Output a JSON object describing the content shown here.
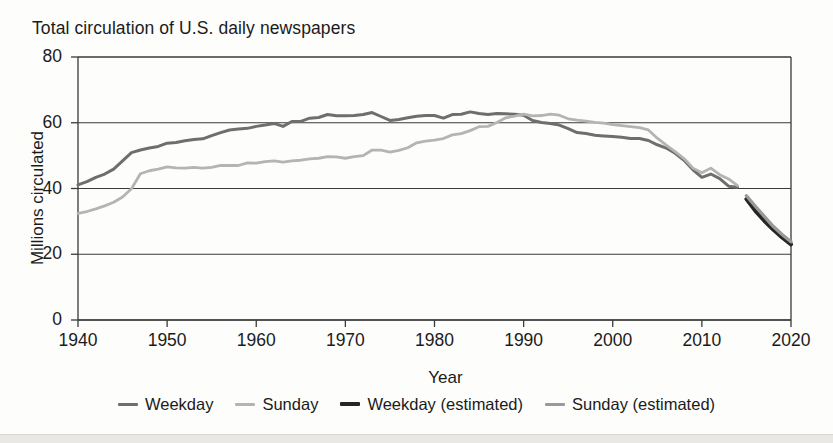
{
  "chart_data": {
    "type": "line",
    "title": "Total circulation of U.S. daily newspapers",
    "xlabel": "Year",
    "ylabel": "Millions circulated",
    "xlim": [
      1940,
      2020
    ],
    "ylim": [
      0,
      80
    ],
    "xticks": [
      1940,
      1950,
      1960,
      1970,
      1980,
      1990,
      2000,
      2010,
      2020
    ],
    "yticks": [
      0,
      20,
      40,
      60,
      80
    ],
    "grid": "horizontal",
    "legend_position": "bottom",
    "colors": {
      "weekday": "#6e6e6e",
      "sunday": "#b4b4b4",
      "weekday_estimated": "#262626",
      "sunday_estimated": "#9a9a9a"
    },
    "series": [
      {
        "name": "Weekday",
        "color": "#6e6e6e",
        "x": [
          1940,
          1941,
          1942,
          1943,
          1944,
          1945,
          1946,
          1947,
          1948,
          1949,
          1950,
          1951,
          1952,
          1953,
          1954,
          1955,
          1956,
          1957,
          1958,
          1959,
          1960,
          1961,
          1962,
          1963,
          1964,
          1965,
          1966,
          1967,
          1968,
          1969,
          1970,
          1971,
          1972,
          1973,
          1974,
          1975,
          1976,
          1977,
          1978,
          1979,
          1980,
          1981,
          1982,
          1983,
          1984,
          1985,
          1986,
          1987,
          1988,
          1989,
          1990,
          1991,
          1992,
          1993,
          1994,
          1995,
          1996,
          1997,
          1998,
          1999,
          2000,
          2001,
          2002,
          2003,
          2004,
          2005,
          2006,
          2007,
          2008,
          2009,
          2010,
          2011,
          2012,
          2013,
          2014
        ],
        "y": [
          41.1,
          42.1,
          43.4,
          44.4,
          45.9,
          48.4,
          50.9,
          51.7,
          52.3,
          52.8,
          53.8,
          54.0,
          54.5,
          54.9,
          55.1,
          56.1,
          57.0,
          57.8,
          58.1,
          58.3,
          58.9,
          59.3,
          59.8,
          58.9,
          60.4,
          60.4,
          61.4,
          61.6,
          62.5,
          62.1,
          62.1,
          62.2,
          62.5,
          63.1,
          61.9,
          60.7,
          61.0,
          61.5,
          62.0,
          62.2,
          62.2,
          61.4,
          62.5,
          62.6,
          63.3,
          62.8,
          62.5,
          62.8,
          62.7,
          62.6,
          62.3,
          60.7,
          60.1,
          59.8,
          59.3,
          58.2,
          57.0,
          56.7,
          56.2,
          56.0,
          55.8,
          55.6,
          55.2,
          55.2,
          54.6,
          53.3,
          52.3,
          50.7,
          48.6,
          45.7,
          43.4,
          44.4,
          43.0,
          40.7,
          40.4
        ],
        "note": "historical reported weekday circulation"
      },
      {
        "name": "Sunday",
        "color": "#b4b4b4",
        "x": [
          1940,
          1941,
          1942,
          1943,
          1944,
          1945,
          1946,
          1947,
          1948,
          1949,
          1950,
          1951,
          1952,
          1953,
          1954,
          1955,
          1956,
          1957,
          1958,
          1959,
          1960,
          1961,
          1962,
          1963,
          1964,
          1965,
          1966,
          1967,
          1968,
          1969,
          1970,
          1971,
          1972,
          1973,
          1974,
          1975,
          1976,
          1977,
          1978,
          1979,
          1980,
          1981,
          1982,
          1983,
          1984,
          1985,
          1986,
          1987,
          1988,
          1989,
          1990,
          1991,
          1992,
          1993,
          1994,
          1995,
          1996,
          1997,
          1998,
          1999,
          2000,
          2001,
          2002,
          2003,
          2004,
          2005,
          2006,
          2007,
          2008,
          2009,
          2010,
          2011,
          2012,
          2013,
          2014
        ],
        "y": [
          32.4,
          33.0,
          33.8,
          34.7,
          35.8,
          37.4,
          39.9,
          44.5,
          45.4,
          45.9,
          46.6,
          46.3,
          46.2,
          46.4,
          46.2,
          46.4,
          47.0,
          47.0,
          47.0,
          47.8,
          47.7,
          48.2,
          48.4,
          48.0,
          48.4,
          48.6,
          49.0,
          49.2,
          49.7,
          49.6,
          49.2,
          49.7,
          50.0,
          51.7,
          51.7,
          51.1,
          51.6,
          52.4,
          53.9,
          54.4,
          54.7,
          55.2,
          56.3,
          56.7,
          57.6,
          58.8,
          58.9,
          60.1,
          61.5,
          62.0,
          62.6,
          62.1,
          62.2,
          62.6,
          62.3,
          61.2,
          60.8,
          60.5,
          60.1,
          59.9,
          59.4,
          59.1,
          58.8,
          58.5,
          57.8,
          55.3,
          53.2,
          51.2,
          49.1,
          46.2,
          44.8,
          46.2,
          44.2,
          42.9,
          40.9
        ],
        "note": "historical reported Sunday circulation"
      },
      {
        "name": "Weekday (estimated)",
        "color": "#262626",
        "x": [
          2015,
          2016,
          2017,
          2018,
          2019,
          2020
        ],
        "y": [
          36.8,
          33.2,
          30.2,
          27.5,
          25.1,
          23.0
        ],
        "note": "estimated weekday circulation"
      },
      {
        "name": "Sunday (estimated)",
        "color": "#9a9a9a",
        "x": [
          2015,
          2016,
          2017,
          2018,
          2019,
          2020
        ],
        "y": [
          37.8,
          34.6,
          31.5,
          28.5,
          26.0,
          23.8
        ],
        "note": "estimated Sunday circulation"
      }
    ]
  },
  "legend": {
    "items": [
      {
        "label": "Weekday",
        "color": "#6e6e6e",
        "thickness": 3
      },
      {
        "label": "Sunday",
        "color": "#b4b4b4",
        "thickness": 3
      },
      {
        "label": "Weekday (estimated)",
        "color": "#262626",
        "thickness": 4
      },
      {
        "label": "Sunday (estimated)",
        "color": "#9a9a9a",
        "thickness": 3.5
      }
    ]
  }
}
